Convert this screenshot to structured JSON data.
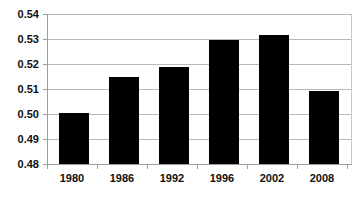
{
  "chart_data": {
    "type": "bar",
    "title": "",
    "subtitle": "",
    "xlabel": "",
    "ylabel": "",
    "categories": [
      "1980",
      "1986",
      "1992",
      "1996",
      "2002",
      "2008"
    ],
    "values": [
      0.5005,
      0.5148,
      0.519,
      0.5297,
      0.5315,
      0.5092
    ],
    "ylim": [
      0.48,
      0.54
    ],
    "ytick_values": [
      0.48,
      0.49,
      0.5,
      0.51,
      0.52,
      0.53,
      0.54
    ],
    "ytick_labels": [
      "0.48",
      "0.49",
      "0.50",
      "0.51",
      "0.52",
      "0.53",
      "0.54"
    ],
    "ytick_step": 0.01,
    "grid": true,
    "grid_axis": "y",
    "legend": false,
    "legend_position": "none",
    "bar_color": "#000000",
    "gridline_color": "#b9b9b9",
    "axis_color": "#9c9c9c",
    "background_color": "#ffffff",
    "annotations": []
  },
  "axes": {
    "y": {
      "ticks": [
        {
          "label": "0.54",
          "value": 0.54
        },
        {
          "label": "0.53",
          "value": 0.53
        },
        {
          "label": "0.52",
          "value": 0.52
        },
        {
          "label": "0.51",
          "value": 0.51
        },
        {
          "label": "0.50",
          "value": 0.5
        },
        {
          "label": "0.49",
          "value": 0.49
        },
        {
          "label": "0.48",
          "value": 0.48
        }
      ]
    },
    "x": {
      "ticks": [
        {
          "label": "1980"
        },
        {
          "label": "1986"
        },
        {
          "label": "1992"
        },
        {
          "label": "1996"
        },
        {
          "label": "2002"
        },
        {
          "label": "2008"
        }
      ]
    }
  }
}
